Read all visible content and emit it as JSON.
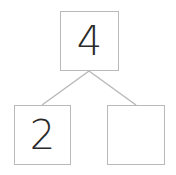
{
  "diagram": {
    "type": "number-bond",
    "whole": {
      "value": "4"
    },
    "parts": [
      {
        "value": "2"
      },
      {
        "value": ""
      }
    ],
    "colors": {
      "border": "#b9b9b9",
      "text": "#2a2a2a",
      "line": "#b9b9b9"
    }
  }
}
